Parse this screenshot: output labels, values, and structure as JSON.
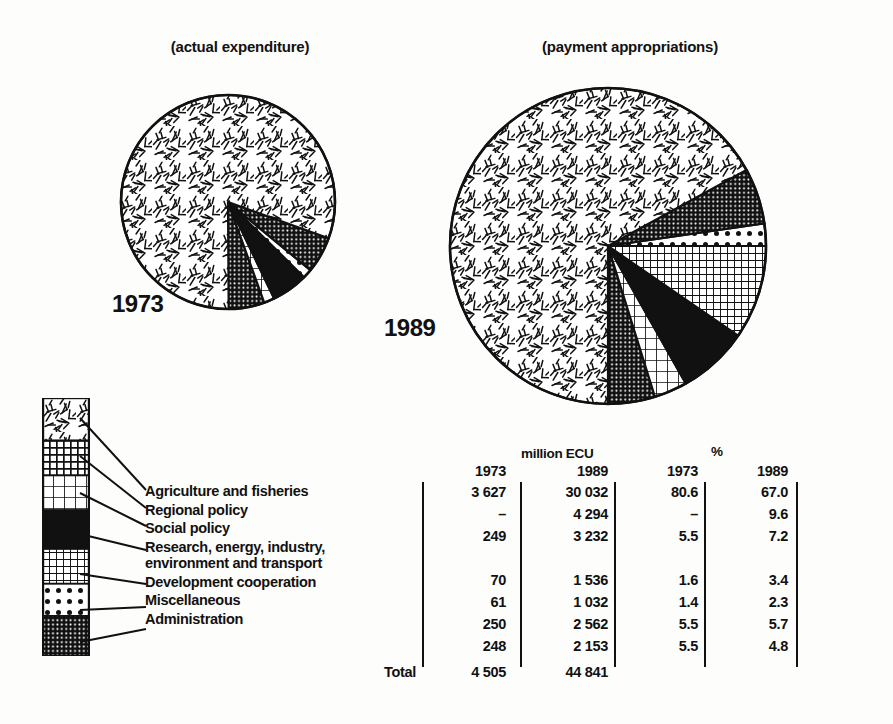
{
  "figure": {
    "chart_left_title": "(actual expenditure)",
    "chart_right_title": "(payment appropriations)",
    "year_left": "1973",
    "year_right": "1989"
  },
  "legend": {
    "items": [
      {
        "label": "Agriculture and fisheries",
        "pattern": "speckle"
      },
      {
        "label": "Regional policy",
        "pattern": "dark-grid"
      },
      {
        "label": "Social policy",
        "pattern": "light-grid"
      },
      {
        "label": "Research, energy, industry, environment and transport",
        "pattern": "solid-black"
      },
      {
        "label": "Development cooperation",
        "pattern": "fine-grid"
      },
      {
        "label": "Miscellaneous",
        "pattern": "dots"
      },
      {
        "label": "Administration",
        "pattern": "dark-mesh"
      }
    ]
  },
  "table": {
    "group_headers": {
      "amount": "million ECU",
      "percent": "%"
    },
    "column_headers": [
      "1973",
      "1989",
      "1973",
      "1989"
    ],
    "rows": [
      {
        "values": [
          "3 627",
          "30 032",
          "80.6",
          "67.0"
        ]
      },
      {
        "values": [
          "–",
          "4 294",
          "–",
          "9.6"
        ]
      },
      {
        "values": [
          "249",
          "3 232",
          "5.5",
          "7.2"
        ]
      },
      {
        "values": [
          "",
          "",
          "",
          ""
        ]
      },
      {
        "values": [
          "70",
          "1 536",
          "1.6",
          "3.4"
        ]
      },
      {
        "values": [
          "61",
          "1 032",
          "1.4",
          "2.3"
        ]
      },
      {
        "values": [
          "250",
          "2 562",
          "5.5",
          "5.7"
        ]
      },
      {
        "values": [
          "248",
          "2 153",
          "5.5",
          "4.8"
        ]
      }
    ],
    "total_label": "Total",
    "total_values": [
      "4 505",
      "44 841",
      "",
      ""
    ]
  },
  "chart_data": [
    {
      "type": "pie",
      "title": "(actual expenditure)",
      "year": "1973",
      "unit": "million ECU",
      "total": 4505,
      "categories": [
        "Agriculture and fisheries",
        "Regional policy",
        "Social policy",
        "Research, energy, industry, environment and transport",
        "Development cooperation",
        "Miscellaneous",
        "Administration"
      ],
      "values": [
        3627,
        0,
        249,
        70,
        61,
        250,
        248
      ],
      "percentages": [
        80.6,
        0,
        5.5,
        1.6,
        1.4,
        5.5,
        5.5
      ],
      "legend_position": "left",
      "grid": false
    },
    {
      "type": "pie",
      "title": "(payment appropriations)",
      "year": "1989",
      "unit": "million ECU",
      "total": 44841,
      "categories": [
        "Agriculture and fisheries",
        "Regional policy",
        "Social policy",
        "Research, energy, industry, environment and transport",
        "Development cooperation",
        "Miscellaneous",
        "Administration"
      ],
      "values": [
        30032,
        4294,
        3232,
        1536,
        1032,
        2562,
        2153
      ],
      "percentages": [
        67.0,
        9.6,
        7.2,
        3.4,
        2.3,
        5.7,
        4.8
      ],
      "legend_position": "left",
      "grid": false
    }
  ]
}
